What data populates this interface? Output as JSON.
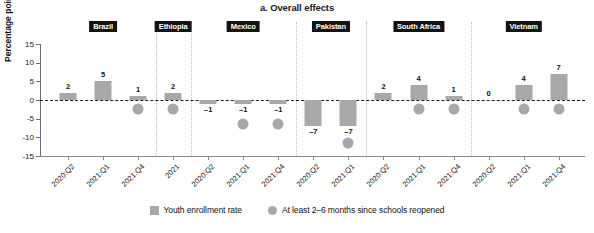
{
  "chart_data": {
    "type": "bar",
    "title": "a. Overall effects",
    "xlabel": "",
    "ylabel": "Percentage point change",
    "ylim": [
      -15,
      15
    ],
    "yticks": [
      15,
      10,
      5,
      0,
      -5,
      -10,
      -15
    ],
    "ytick_labels": [
      "15",
      "10",
      "5",
      "0",
      "-5",
      "-10",
      "-15"
    ],
    "grid": false,
    "legend_position": "bottom",
    "legend": [
      {
        "name": "Youth enrollment rate",
        "marker": "square",
        "color": "#a8a8a8"
      },
      {
        "name": "At least 2–6 months since schools reopened",
        "marker": "circle",
        "color": "#a8a8a8"
      }
    ],
    "groups": [
      {
        "name": "Brazil",
        "categories": [
          "2020:Q2",
          "2021:Q1",
          "2021:Q4"
        ],
        "values": [
          2,
          5,
          1
        ],
        "reopened_marker": [
          null,
          null,
          -2.4
        ]
      },
      {
        "name": "Ethiopia",
        "categories": [
          "2021"
        ],
        "values": [
          2
        ],
        "reopened_marker": [
          -2.4
        ]
      },
      {
        "name": "Mexico",
        "categories": [
          "2020:Q2",
          "2021:Q1",
          "2021:Q4"
        ],
        "values": [
          -1,
          -1,
          -1
        ],
        "reopened_marker": [
          null,
          -6.5,
          -6.5
        ]
      },
      {
        "name": "Pakistan",
        "categories": [
          "2020:Q2",
          "2021:Q1"
        ],
        "values": [
          -7,
          -7
        ],
        "reopened_marker": [
          null,
          -11.5
        ]
      },
      {
        "name": "South Africa",
        "categories": [
          "2020:Q2",
          "2021:Q1",
          "2021:Q4"
        ],
        "values": [
          2,
          4,
          1
        ],
        "reopened_marker": [
          null,
          -2.4,
          -2.4
        ]
      },
      {
        "name": "Vietnam",
        "categories": [
          "2020:Q2",
          "2021:Q1",
          "2021:Q4"
        ],
        "values": [
          0,
          4,
          7
        ],
        "reopened_marker": [
          null,
          -2.4,
          -2.4
        ]
      }
    ]
  },
  "colors": {
    "bar": "#a8a8a8",
    "marker": "#a8a8a8",
    "group_label_bg": "#131313",
    "group_label_text": "#ffffff",
    "axis": "#6e6e6e",
    "separator": "#bdbdbd"
  }
}
